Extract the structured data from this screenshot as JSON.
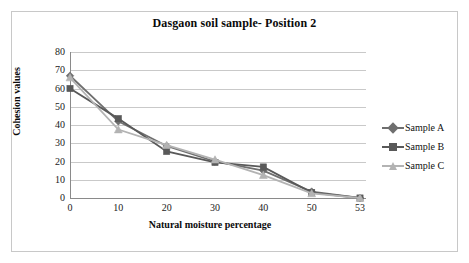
{
  "chart_data": {
    "type": "line",
    "title": "Dasgaon soil sample- Position 2",
    "xlabel": "Natural  moisture percentage",
    "ylabel": "Cohesion values",
    "categories": [
      "0",
      "10",
      "20",
      "30",
      "40",
      "50",
      "53"
    ],
    "x": [
      0,
      10,
      20,
      30,
      40,
      50,
      53
    ],
    "ylim": [
      0,
      80
    ],
    "yticks": [
      "0",
      "10",
      "20",
      "30",
      "40",
      "50",
      "60",
      "70",
      "80"
    ],
    "ytick_values": [
      0,
      10,
      20,
      30,
      40,
      50,
      60,
      70,
      80
    ],
    "grid": true,
    "legend_position": "right",
    "series": [
      {
        "name": "Sample A",
        "marker": "diamond",
        "color": "#6f6f6f",
        "values": [
          67,
          42,
          28.5,
          20,
          15,
          3.5,
          0
        ]
      },
      {
        "name": "Sample B",
        "marker": "square",
        "color": "#595959",
        "values": [
          60,
          43.5,
          25.5,
          19.5,
          17,
          3,
          0
        ]
      },
      {
        "name": "Sample C",
        "marker": "triangle",
        "color": "#b3b3b3",
        "values": [
          66,
          37.5,
          29,
          21,
          12.5,
          2.5,
          0
        ]
      }
    ]
  },
  "colors": {
    "background": "#ffffff",
    "frame_border": "#c8c8c8",
    "gridline": "#c9c9c9",
    "axis_line": "#8a8a8a",
    "text": "#0a0a0a",
    "series_a": "#6f6f6f",
    "series_b": "#595959",
    "series_c": "#b3b3b3"
  }
}
